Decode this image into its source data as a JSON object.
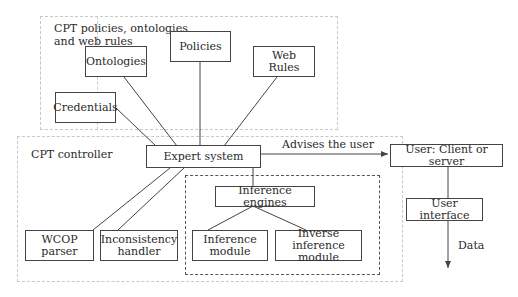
{
  "groups": {
    "policies_group": {
      "title": "CPT policies, ontologies\nand web rules"
    },
    "controller_group": {
      "title": "CPT controller"
    }
  },
  "nodes": {
    "policies": "Policies",
    "ontologies": "Ontologies",
    "web_rules": "Web Rules",
    "credentials": "Credentials",
    "expert_system": "Expert system",
    "inference_engines": "Inference engines",
    "wcop_parser": "WCOP\nparser",
    "inconsistency_handler": "Inconsistency\nhandler",
    "inference_module": "Inference\nmodule",
    "inverse_inference_module": "Inverse inference\nmodule",
    "user_client_server": "User: Client or server",
    "user_interface": "User interface"
  },
  "edges": {
    "advises_label": "Advises the user",
    "data_label": "Data"
  },
  "colors": {
    "line": "#444444",
    "group_border": "#c8c8c8"
  }
}
